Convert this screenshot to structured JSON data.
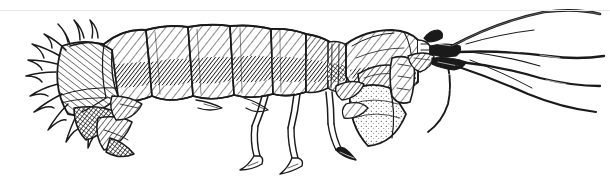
{
  "figure": {
    "kind": "scientific-illustration",
    "technique": "pen-and-ink line drawing with cross-hatching and stipple",
    "view": "lateral, facing right",
    "background_color": "#ffffff",
    "ink_color": "#1a1a1a",
    "shade_color": "#4a4a4a",
    "rule_color": "#e9e9e9",
    "canvas": {
      "width": 610,
      "height": 178
    },
    "alt_text": "Black and white ink drawing of a mantis shrimp in side view, head and antennae to the right, segmented cross-hatched abdomen across the centre, and a spiny tail fan to the left."
  },
  "anatomy": {
    "parts": [
      {
        "name": "tail-fan-uropods",
        "label": "Tail fan (uropods and telson)",
        "side": "left",
        "detail": "fringed with sharp radiating spines"
      },
      {
        "name": "telson-plate",
        "label": "Telson plate",
        "side": "left",
        "detail": "broad hatched plate"
      },
      {
        "name": "abdomen-segments",
        "label": "Abdominal somites",
        "count": 6,
        "detail": "overlapping plates with diagonal hatching, pale dorsal band and dark ventral band"
      },
      {
        "name": "thorax",
        "label": "Thorax",
        "detail": "narrower hatched region bearing walking legs"
      },
      {
        "name": "carapace",
        "label": "Carapace",
        "side": "right",
        "detail": "short shield over the head region"
      },
      {
        "name": "raptorial-appendage",
        "label": "Raptorial claw (maxilliped)",
        "side": "right",
        "detail": "folded stippled striking limb"
      },
      {
        "name": "walking-legs",
        "label": "Walking legs (pereiopods)",
        "count": 3,
        "detail": "slender jointed limbs with small claw tips"
      },
      {
        "name": "pleopods",
        "label": "Pleopods",
        "detail": "small paddles beneath the abdomen"
      },
      {
        "name": "antennae",
        "label": "Antennae and antennules",
        "count": 5,
        "detail": "long tapering flagella sweeping to the right"
      },
      {
        "name": "antennal-scale",
        "label": "Antennal scale",
        "detail": "small leaf-shaped plate at antenna base"
      },
      {
        "name": "eye-stalk",
        "label": "Stalked eye",
        "side": "right"
      }
    ]
  }
}
